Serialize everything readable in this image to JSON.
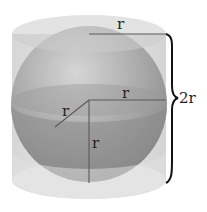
{
  "diagram": {
    "labels": {
      "top_radius": "r",
      "equator_radius": "r",
      "slant_radius": "r",
      "vertical_radius": "r",
      "height": "2r"
    },
    "colors": {
      "cylinder_fill": "#dcdcdc",
      "cylinder_top": "#cfcfcf",
      "sphere_light": "#c8c8c8",
      "sphere_dark": "#8e8e8e",
      "line": "#555555",
      "brace": "#111111"
    }
  }
}
